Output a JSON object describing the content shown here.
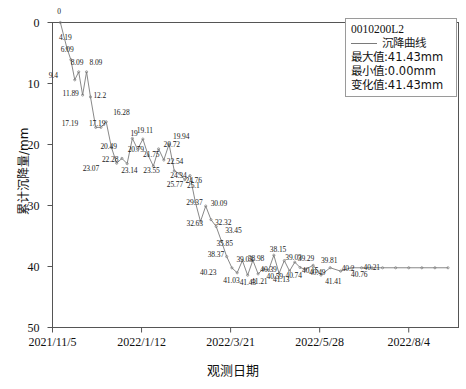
{
  "chart_data": {
    "type": "line",
    "title": "",
    "xlabel": "观测日期",
    "ylabel": "累计沉降量/mm",
    "ylim": [
      0,
      50
    ],
    "y_inverted": true,
    "grid": false,
    "legend_position": "top-right",
    "ytick_labels": [
      "0",
      "10",
      "20",
      "30",
      "40",
      "50"
    ],
    "ytick_values": [
      0,
      10,
      20,
      30,
      40,
      50
    ],
    "xtick_labels": [
      "2021/11/5",
      "2022/1/12",
      "2022/3/21",
      "2022/5/28",
      "2022/8/4"
    ],
    "xtick_values": [
      0,
      68,
      136,
      204,
      272
    ],
    "x_range": [
      0,
      310
    ],
    "series": [
      {
        "name": "沉降曲线",
        "color": "#7a7a7a",
        "x": [
          6,
          11,
          14,
          17,
          20,
          23,
          26,
          29,
          33,
          37,
          41,
          45,
          49,
          53,
          57,
          61,
          65,
          69,
          73,
          77,
          81,
          85,
          89,
          93,
          97,
          101,
          105,
          109,
          113,
          117,
          121,
          125,
          129,
          133,
          137,
          141,
          145,
          149,
          153,
          157,
          161,
          165,
          169,
          173,
          177,
          181,
          185,
          189,
          193,
          199,
          205,
          212,
          220,
          228,
          236,
          244,
          252,
          262,
          272,
          282,
          292,
          302
        ],
        "values": [
          0,
          4.19,
          6.09,
          9.4,
          8.09,
          11.89,
          8.09,
          12.2,
          17.19,
          17.19,
          16.28,
          20.49,
          23.07,
          22.28,
          23.14,
          19.0,
          20.79,
          19.11,
          21.75,
          23.55,
          20.72,
          22.54,
          19.94,
          24.34,
          24.76,
          25.77,
          25.1,
          29.37,
          32.63,
          30.09,
          32.32,
          33.45,
          35.85,
          38.37,
          40.23,
          41.03,
          39.03,
          41.43,
          38.98,
          41.21,
          40.39,
          40.59,
          38.15,
          41.13,
          39.03,
          40.74,
          39.29,
          40.15,
          40.49,
          39.81,
          41.41,
          40.2,
          40.76,
          40.21,
          40.21,
          40.21,
          40.21,
          40.21,
          40.21,
          40.21,
          40.21,
          40.21
        ],
        "point_labels": [
          {
            "text": "0",
            "x": 6,
            "y": 0,
            "dx": -3,
            "dy": -11
          },
          {
            "text": "4.19",
            "x": 11,
            "y": 4.19,
            "dx": -8,
            "dy": -10
          },
          {
            "text": "6.09",
            "x": 14,
            "y": 6.09,
            "dx": -10,
            "dy": -10
          },
          {
            "text": "9.4",
            "x": 17,
            "y": 9.4,
            "dx": -26,
            "dy": -4
          },
          {
            "text": "8.09",
            "x": 20,
            "y": 8.09,
            "dx": -8,
            "dy": -9
          },
          {
            "text": "11.89",
            "x": 23,
            "y": 11.89,
            "dx": -20,
            "dy": -1
          },
          {
            "text": "8.09",
            "x": 26,
            "y": 8.09,
            "dx": 3,
            "dy": -9
          },
          {
            "text": "12.2",
            "x": 29,
            "y": 12.2,
            "dx": 3,
            "dy": -1
          },
          {
            "text": "17.19",
            "x": 33,
            "y": 17.19,
            "dx": -34,
            "dy": -3
          },
          {
            "text": "17.19",
            "x": 37,
            "y": 17.19,
            "dx": -12,
            "dy": -3
          },
          {
            "text": "16.28",
            "x": 41,
            "y": 16.28,
            "dx": 7,
            "dy": -9
          },
          {
            "text": "20.49",
            "x": 45,
            "y": 20.49,
            "dx": -11,
            "dy": 0
          },
          {
            "text": "23.07",
            "x": 49,
            "y": 23.07,
            "dx": -34,
            "dy": 6
          },
          {
            "text": "22.28",
            "x": 53,
            "y": 22.28,
            "dx": -20,
            "dy": 2
          },
          {
            "text": "23.14",
            "x": 57,
            "y": 23.14,
            "dx": -6,
            "dy": 7
          },
          {
            "text": "19",
            "x": 61,
            "y": 19.0,
            "dx": -2,
            "dy": -4
          },
          {
            "text": "20.79",
            "x": 65,
            "y": 20.79,
            "dx": -10,
            "dy": 1
          },
          {
            "text": "19.11",
            "x": 69,
            "y": 19.11,
            "dx": -6,
            "dy": -8
          },
          {
            "text": "21.75",
            "x": 73,
            "y": 21.75,
            "dx": -5,
            "dy": 0
          },
          {
            "text": "23.55",
            "x": 77,
            "y": 23.55,
            "dx": -10,
            "dy": 5
          },
          {
            "text": "20.72",
            "x": 81,
            "y": 20.72,
            "dx": 5,
            "dy": -4
          },
          {
            "text": "22.54",
            "x": 85,
            "y": 22.54,
            "dx": 3,
            "dy": 2
          },
          {
            "text": "19.94",
            "x": 89,
            "y": 19.94,
            "dx": 4,
            "dy": -7
          },
          {
            "text": "24.34",
            "x": 93,
            "y": 24.34,
            "dx": -4,
            "dy": 5
          },
          {
            "text": "24.76",
            "x": 97,
            "y": 24.76,
            "dx": 6,
            "dy": 7
          },
          {
            "text": "25.77",
            "x": 101,
            "y": 25.77,
            "dx": -18,
            "dy": 5
          },
          {
            "text": "25.1",
            "x": 105,
            "y": 25.1,
            "dx": -3,
            "dy": 10
          },
          {
            "text": "29.37",
            "x": 109,
            "y": 29.37,
            "dx": -9,
            "dy": 1
          },
          {
            "text": "32.63",
            "x": 113,
            "y": 32.63,
            "dx": -14,
            "dy": 2
          },
          {
            "text": "30.09",
            "x": 117,
            "y": 30.09,
            "dx": 5,
            "dy": -2
          },
          {
            "text": "32.32",
            "x": 121,
            "y": 32.32,
            "dx": 4,
            "dy": 3
          },
          {
            "text": "33.45",
            "x": 125,
            "y": 33.45,
            "dx": 9,
            "dy": 4
          },
          {
            "text": "35.85",
            "x": 129,
            "y": 35.85,
            "dx": -5,
            "dy": 3
          },
          {
            "text": "38.37",
            "x": 133,
            "y": 38.37,
            "dx": -19,
            "dy": -2
          },
          {
            "text": "40.23",
            "x": 137,
            "y": 40.23,
            "dx": -32,
            "dy": 5
          },
          {
            "text": "41.03",
            "x": 141,
            "y": 41.03,
            "dx": -14,
            "dy": 8
          },
          {
            "text": "39.03",
            "x": 145,
            "y": 39.03,
            "dx": -6,
            "dy": -1
          },
          {
            "text": "41.43",
            "x": 149,
            "y": 41.43,
            "dx": -8,
            "dy": 8
          },
          {
            "text": "38.98",
            "x": 153,
            "y": 38.98,
            "dx": -5,
            "dy": -1
          },
          {
            "text": "41.21",
            "x": 157,
            "y": 41.21,
            "dx": -7,
            "dy": 8
          },
          {
            "text": "40.39",
            "x": 161,
            "y": 40.39,
            "dx": -3,
            "dy": 1
          },
          {
            "text": "40.59",
            "x": 165,
            "y": 40.59,
            "dx": -2,
            "dy": 7
          },
          {
            "text": "38.15",
            "x": 169,
            "y": 38.15,
            "dx": -4,
            "dy": -5
          },
          {
            "text": "41.13",
            "x": 173,
            "y": 41.13,
            "dx": -6,
            "dy": 7
          },
          {
            "text": "39.03",
            "x": 177,
            "y": 39.03,
            "dx": 1,
            "dy": -3
          },
          {
            "text": "40.74",
            "x": 181,
            "y": 40.74,
            "dx": -4,
            "dy": 5
          },
          {
            "text": "39.29",
            "x": 185,
            "y": 39.29,
            "dx": 3,
            "dy": -3
          },
          {
            "text": "40.15",
            "x": 189,
            "y": 40.15,
            "dx": 2,
            "dy": 4
          },
          {
            "text": "40.49",
            "x": 199,
            "y": 40.49,
            "dx": -4,
            "dy": 4
          },
          {
            "text": "39.81",
            "x": 205,
            "y": 39.81,
            "dx": 0,
            "dy": -4
          },
          {
            "text": "41.41",
            "x": 212,
            "y": 41.41,
            "dx": -5,
            "dy": 7
          },
          {
            "text": "40.2",
            "x": 220,
            "y": 40.2,
            "dx": 1,
            "dy": 1
          },
          {
            "text": "40.76",
            "x": 228,
            "y": 40.76,
            "dx": 0,
            "dy": 4
          },
          {
            "text": "40.21",
            "x": 236,
            "y": 40.21,
            "dx": 2,
            "dy": 0
          }
        ]
      }
    ]
  },
  "legend": {
    "id": "0010200L2",
    "series_label": "沉降曲线",
    "max_label": "最大值:41.43mm",
    "min_label": "最小值:0.00mm",
    "change_label": "变化值:41.43mm"
  }
}
